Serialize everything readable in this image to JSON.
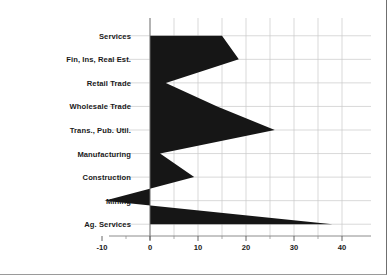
{
  "chart_data": {
    "type": "area",
    "orientation": "horizontal",
    "title": "",
    "subtitle": "",
    "xlabel": "",
    "ylabel": "",
    "categories": [
      "Services",
      "Fin, Ins, Real Est.",
      "Retail Trade",
      "Wholesale Trade",
      "Trans., Pub. Util.",
      "Manufacturing",
      "Construction",
      "Mining",
      "Ag. Services"
    ],
    "values": [
      15.0,
      18.5,
      3.3,
      14.0,
      26.0,
      2.1,
      9.2,
      -9.5,
      38.0
    ],
    "series": [
      {
        "name": "",
        "values": [
          15.0,
          18.5,
          3.3,
          14.0,
          26.0,
          2.1,
          9.2,
          -9.5,
          38.0
        ]
      }
    ],
    "xlim": [
      -13,
      42
    ],
    "ylim": [
      0,
      9
    ],
    "xticks": [
      -10,
      0,
      10,
      20,
      30,
      40
    ],
    "xtick_labels": [
      "-10",
      "0",
      "10",
      "20",
      "30",
      "40"
    ],
    "xminor_ticks": [
      -5,
      5,
      15,
      25,
      35
    ],
    "grid": true,
    "grid_axis": "both",
    "legend": "none",
    "baseline": 0,
    "fill_color": "#161616",
    "grid_color": "#c8c8c8",
    "axis_color": "#808080",
    "text_color": "#1a1a1a"
  }
}
